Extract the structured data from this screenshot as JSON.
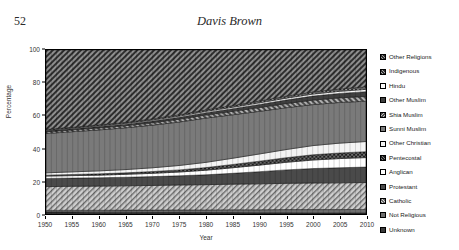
{
  "page": {
    "folio": "52",
    "running_head": "Davis Brown"
  },
  "chart_data": {
    "type": "area",
    "title": "",
    "xlabel": "Year",
    "ylabel": "Percentage",
    "xlim": [
      1950,
      2010
    ],
    "ylim": [
      0,
      100
    ],
    "grid": false,
    "legend_position": "right",
    "xticks": [
      "1950",
      "1955",
      "1960",
      "1965",
      "1970",
      "1975",
      "1980",
      "1985",
      "1990",
      "1995",
      "2000",
      "2005",
      "2010"
    ],
    "yticks": [
      "0",
      "20",
      "40",
      "60",
      "80",
      "100"
    ],
    "x": [
      1950,
      1955,
      1960,
      1965,
      1970,
      1975,
      1980,
      1985,
      1990,
      1995,
      2000,
      2005,
      2010
    ],
    "series": [
      {
        "name": "Unknown",
        "pattern": "solid-dark",
        "color": "#3a3a3a",
        "values": [
          1.2,
          1.2,
          1.1,
          1.1,
          1.0,
          1.0,
          0.9,
          0.9,
          0.8,
          0.8,
          0.7,
          0.7,
          0.7
        ]
      },
      {
        "name": "Not Religious",
        "pattern": "solid-mid",
        "color": "#6e6e6e",
        "values": [
          1.0,
          1.1,
          1.2,
          1.3,
          1.4,
          1.5,
          1.6,
          1.7,
          1.8,
          1.9,
          2.0,
          2.0,
          2.1
        ]
      },
      {
        "name": "Catholic",
        "pattern": "hatch-diag-light",
        "color": "#b8b8b8",
        "values": [
          14.5,
          14.6,
          14.7,
          14.8,
          15.0,
          15.2,
          15.4,
          15.6,
          15.8,
          16.0,
          16.2,
          16.3,
          16.4
        ]
      },
      {
        "name": "Protestant",
        "pattern": "solid-dark2",
        "color": "#4a4a4a",
        "values": [
          5.0,
          5.0,
          5.1,
          5.2,
          5.4,
          5.6,
          6.0,
          6.6,
          7.4,
          8.2,
          8.8,
          9.2,
          9.4
        ]
      },
      {
        "name": "Anglican",
        "pattern": "white",
        "color": "#ffffff",
        "values": [
          1.4,
          1.5,
          1.6,
          1.8,
          2.0,
          2.3,
          2.8,
          3.4,
          4.0,
          4.6,
          5.2,
          5.6,
          5.8
        ]
      },
      {
        "name": "Pentecostal",
        "pattern": "hatch-cross-dark",
        "color": "#555555",
        "values": [
          0.6,
          0.7,
          0.8,
          0.9,
          1.1,
          1.3,
          1.6,
          2.0,
          2.4,
          2.8,
          3.2,
          3.4,
          3.6
        ]
      },
      {
        "name": "Other Christian",
        "pattern": "white2",
        "color": "#f2f2f2",
        "values": [
          1.4,
          1.6,
          1.8,
          2.0,
          2.3,
          2.7,
          3.2,
          3.8,
          4.4,
          5.0,
          5.6,
          6.0,
          6.2
        ]
      },
      {
        "name": "Sunni Muslim",
        "pattern": "solid-mid2",
        "color": "#7a7a7a",
        "values": [
          24.0,
          24.5,
          25.0,
          25.5,
          26.0,
          26.5,
          27.0,
          26.5,
          26.0,
          25.5,
          25.0,
          24.8,
          24.6
        ]
      },
      {
        "name": "Shia Muslim",
        "pattern": "hatch-diag-mid",
        "color": "#909090",
        "values": [
          1.0,
          1.1,
          1.2,
          1.3,
          1.5,
          1.7,
          1.9,
          2.1,
          2.3,
          2.5,
          2.7,
          2.8,
          2.9
        ]
      },
      {
        "name": "Other Muslim",
        "pattern": "solid-dark3",
        "color": "#3f3f3f",
        "values": [
          0.6,
          0.7,
          0.8,
          0.9,
          1.0,
          1.2,
          1.4,
          1.6,
          1.9,
          2.2,
          2.5,
          2.7,
          2.9
        ]
      },
      {
        "name": "Hindu",
        "pattern": "white3",
        "color": "#fbfbfb",
        "values": [
          0.4,
          0.4,
          0.5,
          0.5,
          0.6,
          0.7,
          0.8,
          0.9,
          1.0,
          1.1,
          1.2,
          1.3,
          1.4
        ]
      },
      {
        "name": "Indigenous",
        "pattern": "hatch-cross-mid",
        "color": "#8a8a8a",
        "values": [
          0.5,
          0.5,
          0.6,
          0.6,
          0.7,
          0.8,
          0.9,
          1.0,
          1.1,
          1.2,
          1.3,
          1.4,
          1.5
        ]
      },
      {
        "name": "Other Religions",
        "pattern": "hatch-diag-dark",
        "color": "#6a6a6a",
        "values": [
          48.4,
          47.1,
          45.6,
          44.1,
          42.0,
          39.5,
          36.5,
          33.9,
          31.1,
          28.2,
          25.6,
          23.8,
          22.5
        ]
      }
    ]
  },
  "legend": {
    "items": [
      {
        "label": "Other Religions",
        "pattern": "hatch-diag-dark"
      },
      {
        "label": "Indigenous",
        "pattern": "hatch-cross-mid"
      },
      {
        "label": "Hindu",
        "pattern": "white3"
      },
      {
        "label": "Other Muslim",
        "pattern": "solid-dark3"
      },
      {
        "label": "Shia Muslim",
        "pattern": "hatch-diag-mid"
      },
      {
        "label": "Sunni Muslim",
        "pattern": "solid-mid2"
      },
      {
        "label": "Other Christian",
        "pattern": "white2"
      },
      {
        "label": "Pentecostal",
        "pattern": "hatch-cross-dark"
      },
      {
        "label": "Anglican",
        "pattern": "white"
      },
      {
        "label": "Protestant",
        "pattern": "solid-dark2"
      },
      {
        "label": "Catholic",
        "pattern": "hatch-diag-light"
      },
      {
        "label": "Not Religious",
        "pattern": "solid-mid"
      },
      {
        "label": "Unknown",
        "pattern": "solid-dark"
      }
    ]
  }
}
